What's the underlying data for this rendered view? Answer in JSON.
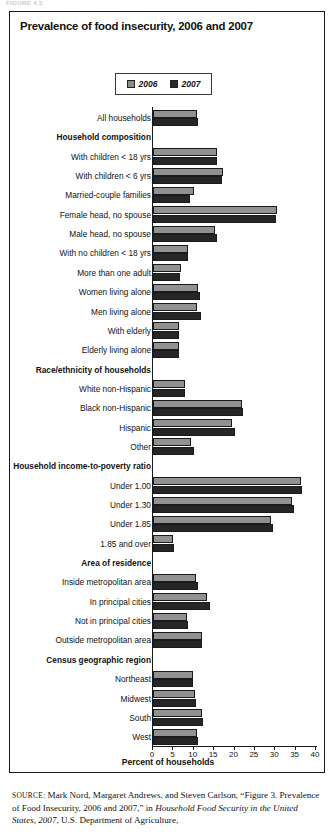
{
  "figure_label": "FIGURE 4.5",
  "title": "Prevalence of food insecurity, 2006 and 2007",
  "legend": {
    "items": [
      {
        "label": "2006",
        "color": "#919191"
      },
      {
        "label": "2007",
        "color": "#262626"
      }
    ]
  },
  "axis": {
    "xlabel": "Percent of households",
    "ticks": [
      0,
      5,
      10,
      15,
      20,
      25,
      30,
      35,
      40
    ],
    "tick_labels": [
      "0",
      "5",
      "10",
      "15",
      "20",
      "25",
      "30",
      "35",
      "40"
    ]
  },
  "source": {
    "prefix": "SOURCE:",
    "text_1": " Mark Nord, Margaret Andrews, and Steven Carlson, “Figure 3. Prevalence of Food Insecurity, 2006 and 2007,” in ",
    "italic_1": "Household Food Security in the United States, 2007",
    "text_2": ", U.S. Department of Agriculture,"
  },
  "chart_data": {
    "type": "bar",
    "orientation": "horizontal",
    "title": "Prevalence of food insecurity, 2006 and 2007",
    "xlabel": "Percent of households",
    "ylabel": "",
    "xlim": [
      0,
      40
    ],
    "grid": false,
    "legend_position": "top-center",
    "categories": [
      "All households",
      "Household composition",
      "With children < 18 yrs",
      "With children < 6 yrs",
      "Married-couple families",
      "Female head, no spouse",
      "Male head, no spouse",
      "With no children < 18 yrs",
      "More than one adult",
      "Women living alone",
      "Men living alone",
      "With elderly",
      "Elderly living alone",
      "Race/ethnicity of households",
      "White non-Hispanic",
      "Black non-Hispanic",
      "Hispanic",
      "Other",
      "Household income-to-poverty ratio",
      "Under 1.00",
      "Under 1.30",
      "Under 1.85",
      "1.85 and over",
      "Area of residence",
      "Inside metropolitan area",
      "In principal cities",
      "Not in principal cities",
      "Outside metropolitan area",
      "Census geographic region",
      "Northeast",
      "Midwest",
      "South",
      "West"
    ],
    "group_headers": [
      "Household composition",
      "Race/ethnicity of households",
      "Household income-to-poverty ratio",
      "Area of residence",
      "Census geographic region"
    ],
    "series": [
      {
        "name": "2006",
        "color": "#919191",
        "values": [
          10.9,
          null,
          15.6,
          17.2,
          10.1,
          30.4,
          15.2,
          8.6,
          6.8,
          11.0,
          10.9,
          6.3,
          6.3,
          null,
          7.8,
          21.8,
          19.5,
          9.4,
          null,
          36.3,
          34.0,
          28.9,
          5.0,
          null,
          10.6,
          13.2,
          8.3,
          12.0,
          null,
          9.7,
          10.2,
          12.0,
          10.8
        ]
      },
      {
        "name": "2007",
        "color": "#262626",
        "values": [
          11.1,
          null,
          15.8,
          16.9,
          9.0,
          30.2,
          15.7,
          8.7,
          6.6,
          11.6,
          11.7,
          6.5,
          6.5,
          null,
          7.9,
          22.2,
          20.1,
          10.0,
          null,
          36.6,
          34.5,
          29.5,
          5.2,
          null,
          11.0,
          14.0,
          8.5,
          12.0,
          null,
          9.9,
          10.5,
          12.3,
          11.1
        ]
      }
    ]
  }
}
